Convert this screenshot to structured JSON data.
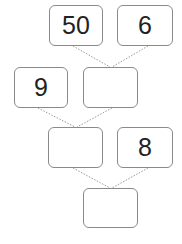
{
  "diagram": {
    "type": "number-tree",
    "boxes": [
      {
        "id": "top-left",
        "value": "50"
      },
      {
        "id": "top-right",
        "value": "6"
      },
      {
        "id": "mid-left",
        "value": "9"
      },
      {
        "id": "mid-right",
        "value": ""
      },
      {
        "id": "lower-left",
        "value": ""
      },
      {
        "id": "lower-right",
        "value": "8"
      },
      {
        "id": "bottom",
        "value": ""
      }
    ],
    "line_color": "#9a9a9a"
  }
}
